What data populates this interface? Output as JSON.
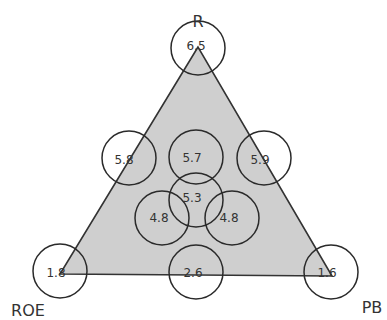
{
  "diagram": {
    "type": "triangle-circles",
    "triangle": {
      "vertices": [
        [
          198,
          47
        ],
        [
          60,
          274
        ],
        [
          332,
          276
        ]
      ],
      "fill": "#cfcfcf",
      "stroke": "#333333"
    },
    "vertex_labels": [
      {
        "text": "R",
        "x": 198,
        "y": 22
      },
      {
        "text": "ROE",
        "x": 28,
        "y": 311
      },
      {
        "text": "PB",
        "x": 372,
        "y": 308
      }
    ],
    "circles": [
      {
        "id": "apex",
        "cx": 198,
        "cy": 48,
        "r": 27,
        "value": "6.5",
        "tx": 196,
        "ty": 46
      },
      {
        "id": "left-edge",
        "cx": 129,
        "cy": 158,
        "r": 27,
        "value": "5.8",
        "tx": 124,
        "ty": 160
      },
      {
        "id": "top-center",
        "cx": 196,
        "cy": 157,
        "r": 27,
        "value": "5.7",
        "tx": 192,
        "ty": 158
      },
      {
        "id": "right-edge",
        "cx": 264,
        "cy": 158,
        "r": 27,
        "value": "5.9",
        "tx": 260,
        "ty": 160
      },
      {
        "id": "center",
        "cx": 196,
        "cy": 200,
        "r": 27,
        "value": "5.3",
        "tx": 192,
        "ty": 198
      },
      {
        "id": "lower-left",
        "cx": 162,
        "cy": 218,
        "r": 27,
        "value": "4.8",
        "tx": 159,
        "ty": 218
      },
      {
        "id": "lower-right",
        "cx": 232,
        "cy": 218,
        "r": 27,
        "value": "4.8",
        "tx": 229,
        "ty": 218
      },
      {
        "id": "bottom-left",
        "cx": 60,
        "cy": 271,
        "r": 27,
        "value": "1.8",
        "tx": 56,
        "ty": 273
      },
      {
        "id": "bottom-center",
        "cx": 196,
        "cy": 272,
        "r": 27,
        "value": "2.6",
        "tx": 193,
        "ty": 273
      },
      {
        "id": "bottom-right",
        "cx": 331,
        "cy": 272,
        "r": 27,
        "value": "1.6",
        "tx": 327,
        "ty": 273
      }
    ]
  }
}
